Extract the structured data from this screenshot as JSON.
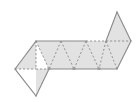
{
  "figure": {
    "type": "geometric-net",
    "canvas": {
      "width": 140,
      "height": 102
    },
    "colors": {
      "background": "#ffffff",
      "face_fill": "#e2e2e2",
      "outline": "#8a8a8a",
      "fold_line": "#8a8a8a"
    },
    "style": {
      "outline_width": 1.1,
      "fold_width": 0.9,
      "fold_dash": "2.2 1.8"
    },
    "vertices": {
      "top_row": [
        {
          "name": "T1",
          "x": 36,
          "y": 41
        },
        {
          "name": "T2",
          "x": 61,
          "y": 41
        },
        {
          "name": "T3",
          "x": 86,
          "y": 41
        },
        {
          "name": "T4",
          "x": 106,
          "y": 41
        },
        {
          "name": "T5",
          "x": 131,
          "y": 41
        }
      ],
      "bottom_row": [
        {
          "name": "B0",
          "x": 15,
          "y": 69
        },
        {
          "name": "B1",
          "x": 36,
          "y": 69
        },
        {
          "name": "B2",
          "x": 49,
          "y": 69
        },
        {
          "name": "B3",
          "x": 74,
          "y": 69
        },
        {
          "name": "B4",
          "x": 99,
          "y": 69
        },
        {
          "name": "B5",
          "x": 117,
          "y": 69
        }
      ],
      "flaps": [
        {
          "name": "lower_left_apex",
          "x": 36,
          "y": 96
        },
        {
          "name": "upper_right_apex",
          "x": 117,
          "y": 12
        }
      ]
    },
    "outline_path": "M 36,41 L 131,41 L 117,69 L 49,69 L 36,96 L 15,69 Z",
    "upper_right_flap_path": "M 106,41 L 117,12 L 131,41 Z",
    "faces": [
      {
        "id": "f1",
        "kind": "parallelogram",
        "path": "M 15,69 L 36,41 L 36,69 Z"
      },
      {
        "id": "f2",
        "kind": "triangle-up",
        "path": "M 36,41 L 61,41 L 49,69 Z"
      },
      {
        "id": "f3",
        "kind": "triangle-down",
        "path": "M 36,69 L 49,69 L 36,96 Z"
      },
      {
        "id": "f4",
        "kind": "triangle-down",
        "path": "M 49,69 L 74,69 L 61,41 Z"
      },
      {
        "id": "f5",
        "kind": "triangle-up",
        "path": "M 61,41 L 86,41 L 74,69 Z"
      },
      {
        "id": "f6",
        "kind": "triangle-down",
        "path": "M 74,69 L 99,69 L 86,41 Z"
      },
      {
        "id": "f7",
        "kind": "triangle-up",
        "path": "M 86,41 L 106,41 L 99,69 Z"
      },
      {
        "id": "f8",
        "kind": "triangle-down",
        "path": "M 99,69 L 117,69 L 106,41 Z"
      },
      {
        "id": "f9",
        "kind": "triangle-right",
        "path": "M 106,41 L 131,41 L 117,69 Z"
      },
      {
        "id": "f10",
        "kind": "triangle-flap",
        "path": "M 106,41 L 117,12 L 131,41 Z"
      }
    ],
    "fold_lines": [
      {
        "id": "fold-base-left",
        "x1": 15,
        "y1": 69,
        "x2": 36,
        "y2": 69
      },
      {
        "id": "fold-base-left-2",
        "x1": 36,
        "y1": 69,
        "x2": 49,
        "y2": 69
      },
      {
        "id": "fold-diag-1",
        "x1": 36,
        "y1": 41,
        "x2": 49,
        "y2": 69
      },
      {
        "id": "fold-diag-2",
        "x1": 61,
        "y1": 41,
        "x2": 49,
        "y2": 69
      },
      {
        "id": "fold-diag-3",
        "x1": 61,
        "y1": 41,
        "x2": 74,
        "y2": 69
      },
      {
        "id": "fold-diag-4",
        "x1": 86,
        "y1": 41,
        "x2": 74,
        "y2": 69
      },
      {
        "id": "fold-diag-5",
        "x1": 86,
        "y1": 41,
        "x2": 99,
        "y2": 69
      },
      {
        "id": "fold-diag-6",
        "x1": 106,
        "y1": 41,
        "x2": 99,
        "y2": 69
      },
      {
        "id": "fold-diag-7",
        "x1": 106,
        "y1": 41,
        "x2": 117,
        "y2": 69
      },
      {
        "id": "fold-top-right",
        "x1": 86,
        "y1": 41,
        "x2": 131,
        "y2": 41
      },
      {
        "id": "fold-left-edge-inner",
        "x1": 36,
        "y1": 41,
        "x2": 36,
        "y2": 69
      }
    ],
    "solid_edges": [
      {
        "id": "edge-top-left",
        "x1": 36,
        "y1": 41,
        "x2": 86,
        "y2": 41
      },
      {
        "id": "edge-upper-right-left",
        "x1": 106,
        "y1": 41,
        "x2": 117,
        "y2": 12
      },
      {
        "id": "edge-upper-right-right",
        "x1": 117,
        "y1": 12,
        "x2": 131,
        "y2": 41
      },
      {
        "id": "edge-right-slant",
        "x1": 131,
        "y1": 41,
        "x2": 117,
        "y2": 69
      },
      {
        "id": "edge-baseline",
        "x1": 117,
        "y1": 69,
        "x2": 49,
        "y2": 69
      },
      {
        "id": "edge-lower-left-right",
        "x1": 49,
        "y1": 69,
        "x2": 36,
        "y2": 96
      },
      {
        "id": "edge-lower-left-left",
        "x1": 36,
        "y1": 96,
        "x2": 15,
        "y2": 69
      },
      {
        "id": "edge-left-slant",
        "x1": 15,
        "y1": 69,
        "x2": 36,
        "y2": 41
      }
    ],
    "vertex_marks": [
      {
        "id": "mark-b2",
        "x": 49,
        "y": 69
      },
      {
        "id": "mark-b3",
        "x": 74,
        "y": 69
      },
      {
        "id": "mark-b4",
        "x": 99,
        "y": 69
      }
    ]
  }
}
